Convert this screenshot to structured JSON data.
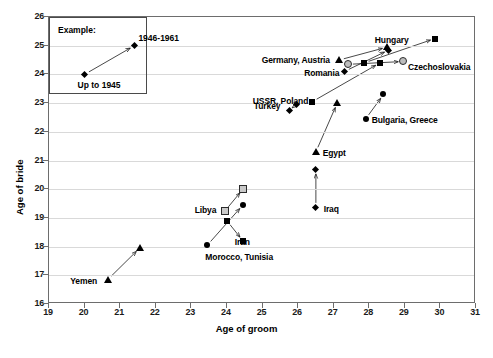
{
  "chart_data": {
    "type": "scatter",
    "title": "",
    "xlabel": "Age of groom",
    "ylabel": "Age of bride",
    "xlim": [
      19,
      31
    ],
    "ylim": [
      16,
      26
    ],
    "xticks": [
      19,
      20,
      21,
      22,
      23,
      24,
      25,
      26,
      27,
      28,
      29,
      30,
      31
    ],
    "yticks": [
      16,
      17,
      18,
      19,
      20,
      21,
      22,
      23,
      24,
      25,
      26
    ],
    "grid": true,
    "legend_position": "none",
    "annotation_box": {
      "title": "Example:",
      "start_label": "Up to 1945",
      "end_label": "1946-1961",
      "start_point": [
        20.0,
        24.0
      ],
      "end_point": [
        21.4,
        25.0
      ]
    },
    "series": [
      {
        "name": "Yemen",
        "marker": "triangle-filled",
        "label": "Yemen",
        "label_pos": "left",
        "points": [
          {
            "period": "Up to 1945",
            "x": 20.65,
            "y": 16.85
          },
          {
            "period": "1946-1961",
            "x": 21.55,
            "y": 17.95
          }
        ]
      },
      {
        "name": "Morocco, Tunisia",
        "marker": "circle-filled",
        "label": "Morocco, Tunisia",
        "label_pos": "below",
        "points": [
          {
            "period": "Up to 1945",
            "x": 23.45,
            "y": 18.05
          },
          {
            "period": "1946-1961",
            "x": 24.45,
            "y": 19.45
          }
        ]
      },
      {
        "name": "Libya",
        "marker": "square-open",
        "label": "Libya",
        "label_pos": "left",
        "points": [
          {
            "period": "Up to 1945",
            "x": 23.95,
            "y": 19.25
          },
          {
            "period": "1946-1961",
            "x": 24.45,
            "y": 20.0
          }
        ]
      },
      {
        "name": "Iran",
        "marker": "square-filled",
        "label": "Iran",
        "label_pos": "right",
        "points": [
          {
            "period": "Up to 1945",
            "x": 24.0,
            "y": 18.9
          },
          {
            "period": "1946-1961",
            "x": 24.45,
            "y": 18.2
          }
        ]
      },
      {
        "name": "Iraq",
        "marker": "diamond-filled",
        "label": "Iraq",
        "label_pos": "right",
        "points": [
          {
            "period": "Up to 1945",
            "x": 26.5,
            "y": 19.35
          },
          {
            "period": "1946-1961",
            "x": 26.5,
            "y": 20.7
          }
        ]
      },
      {
        "name": "Egypt",
        "marker": "triangle-filled",
        "label": "Egypt",
        "label_pos": "right",
        "points": [
          {
            "period": "Up to 1945",
            "x": 26.5,
            "y": 21.3
          },
          {
            "period": "1946-1961",
            "x": 27.1,
            "y": 23.0
          }
        ]
      },
      {
        "name": "Turkey",
        "marker": "diamond-filled",
        "label": "Turkey",
        "label_pos": "left",
        "points": [
          {
            "period": "Up to 1945",
            "x": 25.75,
            "y": 22.75
          },
          {
            "period": "1946-1961",
            "x": 25.95,
            "y": 22.95
          }
        ]
      },
      {
        "name": "Bulgaria, Greece",
        "marker": "circle-filled",
        "label": "Bulgaria, Greece",
        "label_pos": "right",
        "points": [
          {
            "period": "Up to 1945",
            "x": 27.9,
            "y": 22.45
          },
          {
            "period": "1946-1961",
            "x": 28.4,
            "y": 23.3
          }
        ]
      },
      {
        "name": "USSR, Poland",
        "marker": "square-filled",
        "label": "USSR, Poland",
        "label_pos": "left",
        "points": [
          {
            "period": "Up to 1945",
            "x": 26.4,
            "y": 23.05
          },
          {
            "period": "1946-1961",
            "x": 28.3,
            "y": 24.4
          }
        ]
      },
      {
        "name": "Germany, Austria",
        "marker": "triangle-filled",
        "label": "Germany, Austria",
        "label_pos": "left",
        "points": [
          {
            "period": "Up to 1945",
            "x": 27.15,
            "y": 24.5
          },
          {
            "period": "1946-1961",
            "x": 28.5,
            "y": 24.95
          }
        ]
      },
      {
        "name": "Romania",
        "marker": "diamond-filled",
        "label": "Romania",
        "label_pos": "left",
        "points": [
          {
            "period": "Up to 1945",
            "x": 27.3,
            "y": 24.1
          },
          {
            "period": "1946-1961",
            "x": 28.55,
            "y": 24.85
          }
        ]
      },
      {
        "name": "Hungary",
        "marker": "square-filled",
        "label": "Hungary",
        "label_pos": "above",
        "points": [
          {
            "period": "Up to 1945",
            "x": 27.85,
            "y": 24.4
          },
          {
            "period": "1946-1961",
            "x": 29.85,
            "y": 25.25
          }
        ]
      },
      {
        "name": "Czechoslovakia",
        "marker": "circle-open",
        "label": "Czechoslovakia",
        "label_pos": "right",
        "points": [
          {
            "period": "Up to 1945",
            "x": 27.4,
            "y": 24.35
          },
          {
            "period": "1946-1961",
            "x": 28.95,
            "y": 24.45
          }
        ]
      }
    ]
  }
}
